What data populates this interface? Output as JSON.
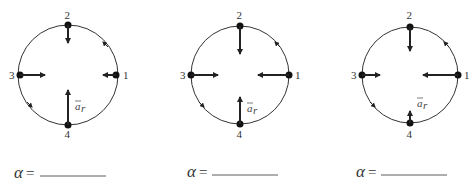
{
  "figure": {
    "point_labels": [
      "1",
      "2",
      "3",
      "4"
    ],
    "vector_label": "a",
    "vector_subscript": "r",
    "alpha_symbol": "α",
    "equals": "=",
    "colors": {
      "ink": "#222222",
      "circle": "#333333",
      "background": "#ffffff"
    },
    "motion_direction": "counterclockwise",
    "diagrams": [
      {
        "id": 1,
        "center": [
          68,
          75
        ],
        "radius": 50,
        "arrow_lengths": {
          "p1": 13,
          "p2": 18,
          "p3": 25,
          "p4": 35
        },
        "answer_label": "α =",
        "answer_value": ""
      },
      {
        "id": 2,
        "center": [
          240,
          75
        ],
        "radius": 49,
        "arrow_lengths": {
          "p1": 32,
          "p2": 28,
          "p3": 26,
          "p4": 27
        },
        "answer_label": "α =",
        "answer_value": ""
      },
      {
        "id": 3,
        "center": [
          410,
          75
        ],
        "radius": 48,
        "arrow_lengths": {
          "p1": 35,
          "p2": 25,
          "p3": 18,
          "p4": 13
        },
        "answer_label": "α =",
        "answer_value": ""
      }
    ]
  }
}
